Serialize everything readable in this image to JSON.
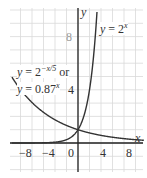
{
  "chart_data": {
    "type": "line",
    "title": "",
    "xlabel": "x",
    "ylabel": "y",
    "xlim": [
      -10,
      11
    ],
    "ylim": [
      -2.0,
      10.5
    ],
    "x_ticks": [
      -8,
      -4,
      0,
      4,
      8
    ],
    "y_ticks": [
      4,
      8
    ],
    "grid": true,
    "series": [
      {
        "name": "y = 2^x",
        "formula": "2^x",
        "x": [
          -10,
          -8,
          -4,
          -2,
          0,
          1,
          2,
          3,
          3.3
        ],
        "values": [
          0.001,
          0.004,
          0.0625,
          0.25,
          1,
          2,
          4,
          8,
          9.85
        ]
      },
      {
        "name": "y = 2^(-x/5) or y = 0.87^x",
        "formula": "0.87^x",
        "x": [
          -10,
          -8,
          -4,
          0,
          4,
          8,
          10
        ],
        "values": [
          4.0,
          3.03,
          1.74,
          1,
          0.57,
          0.33,
          0.25
        ]
      }
    ],
    "annotations": [
      {
        "text": "y = 2^x",
        "near": "top-right of steep curve"
      },
      {
        "text": "y = 2^(-x/5) or y = 0.87^x",
        "near": "left, above decaying curve"
      }
    ]
  },
  "labels": {
    "y_axis": "y",
    "x_axis": "x",
    "tick_x": [
      "−8",
      "−4",
      "0",
      "4",
      "8"
    ],
    "tick_y_4": "4",
    "tick_y_8": "8",
    "curve1_prefix": "y = 2",
    "curve1_exp": "x",
    "curve2_line1_prefix": "y = 2",
    "curve2_line1_exp": "−x/5",
    "curve2_line1_suffix": " or",
    "curve2_line2_prefix": "y = 0.87",
    "curve2_line2_exp": "x"
  },
  "colors": {
    "grid": "#d9d9d9",
    "axis": "#222222",
    "curve": "#333333"
  }
}
